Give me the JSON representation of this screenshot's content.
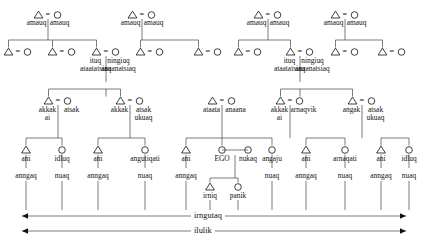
{
  "diagram": {
    "symbols": {
      "male": "triangle",
      "female": "circle",
      "marriage": "="
    },
    "colors": {
      "ink": "#111111",
      "line": "#444444",
      "background": "#ffffff"
    }
  },
  "generation1": {
    "name": "great-grandparents",
    "couples": [
      {
        "x": 48,
        "male": "amauq",
        "female": "amauq"
      },
      {
        "x": 142,
        "male": "amauq",
        "female": "amauq"
      },
      {
        "x": 268,
        "male": "amauq",
        "female": "amauq"
      },
      {
        "x": 345,
        "male": "amauq",
        "female": "amauq"
      }
    ]
  },
  "generation2": {
    "name": "grandparents",
    "couples": [
      {
        "x": 18,
        "male": "",
        "female": ""
      },
      {
        "x": 62,
        "male": "",
        "female": ""
      },
      {
        "x": 106,
        "male": "ituq",
        "female": "ningiuq",
        "male2": "ataatatsiaq",
        "female2": "anaanatsiaq"
      },
      {
        "x": 150,
        "male": "",
        "female": ""
      },
      {
        "x": 208,
        "male": "",
        "female": ""
      },
      {
        "x": 248,
        "male": "",
        "female": ""
      },
      {
        "x": 300,
        "male": "ituq",
        "female": "ningiuq",
        "male2": "ataatatsiaq",
        "female2": "anaanatsiaq"
      },
      {
        "x": 345,
        "male": "",
        "female": ""
      },
      {
        "x": 392,
        "male": "",
        "female": ""
      }
    ]
  },
  "generation3": {
    "name": "parents-aunts-uncles",
    "couples": [
      {
        "x": 58,
        "male": "akkak",
        "male_line2": "ai",
        "female": "atsak",
        "female_line2": ""
      },
      {
        "x": 130,
        "male": "akkak",
        "male_line2": "",
        "female": "atsak",
        "female_line2": "ukuaq"
      },
      {
        "x": 222,
        "male": "ataata",
        "male_line2": "",
        "female": "anaana",
        "female_line2": ""
      },
      {
        "x": 290,
        "male": "akkak",
        "male_line2": "ai",
        "female": "arnaqvik",
        "female_line2": ""
      },
      {
        "x": 362,
        "male": "angak",
        "male_line2": "",
        "female": "atsak",
        "female_line2": "ukuaq"
      }
    ]
  },
  "generation4": {
    "name": "ego-and-cousins",
    "nodes": [
      {
        "x": 26,
        "sex": "male",
        "label": "ani"
      },
      {
        "x": 62,
        "sex": "female",
        "label": "idluq"
      },
      {
        "x": 98,
        "sex": "male",
        "label": "ani"
      },
      {
        "x": 145,
        "sex": "female",
        "label": "angutiqati"
      },
      {
        "x": 186,
        "sex": "male",
        "label": "ani"
      },
      {
        "x": 222,
        "sex": "female",
        "label": "EGO"
      },
      {
        "x": 248,
        "sex": "female",
        "label": "nukaq"
      },
      {
        "x": 272,
        "sex": "female",
        "label": "angaju"
      },
      {
        "x": 306,
        "sex": "male",
        "label": "ani"
      },
      {
        "x": 345,
        "sex": "female",
        "label": "arnaqati"
      },
      {
        "x": 381,
        "sex": "male",
        "label": "ani"
      },
      {
        "x": 409,
        "sex": "female",
        "label": "idluq"
      }
    ]
  },
  "generation5": {
    "name": "nieces-nephews-children",
    "nodes": [
      {
        "x": 26,
        "label": "anngaq"
      },
      {
        "x": 62,
        "label": "nuaq"
      },
      {
        "x": 98,
        "label": "anngaq"
      },
      {
        "x": 145,
        "label": "nuaq"
      },
      {
        "x": 186,
        "label": "anngaq"
      },
      {
        "x": 272,
        "label": "nuaq"
      },
      {
        "x": 306,
        "label": "anngaq"
      },
      {
        "x": 345,
        "label": "nuaq"
      },
      {
        "x": 381,
        "label": "anngaq"
      },
      {
        "x": 409,
        "label": "nuaq"
      }
    ],
    "ego_children": [
      {
        "x": 210,
        "sex": "male",
        "label": "irniq"
      },
      {
        "x": 238,
        "sex": "female",
        "label": "panik"
      }
    ]
  },
  "range_arrows": [
    {
      "label": "irngutaq",
      "y": 216,
      "x1": 22,
      "x2": 406,
      "label_x": 213
    },
    {
      "label": "ilulik",
      "y": 231,
      "x1": 22,
      "x2": 406,
      "label_x": 213
    }
  ]
}
